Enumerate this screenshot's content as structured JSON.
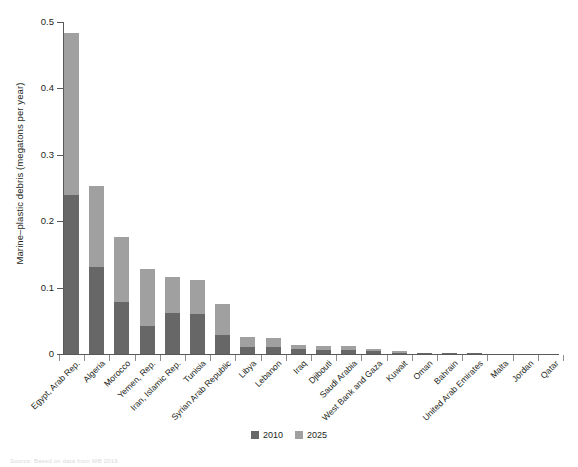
{
  "chart_data": {
    "type": "bar",
    "title": "",
    "subtitle": "",
    "xlabel": "",
    "ylabel": "Marine–plastic debris (megatons per year)",
    "ylim": [
      0,
      0.5
    ],
    "yticks": [
      0,
      0.1,
      0.2,
      0.3,
      0.4,
      0.5
    ],
    "ytick_labels": [
      "0",
      "0.1",
      "0.2",
      "0.3",
      "0.4",
      "0.5"
    ],
    "grid": false,
    "stacked": true,
    "legend_position": "bottom-center",
    "categories": [
      "Egypt, Arab Rep.",
      "Algeria",
      "Morocco",
      "Yemen, Rep.",
      "Iran, Islamic Rep.",
      "Tunisia",
      "Syrian Arab Republic",
      "Libya",
      "Lebanon",
      "Iraq",
      "Djibouti",
      "Saudi Arabia",
      "West Bank and Gaza",
      "Kuwait",
      "Oman",
      "Bahrain",
      "United Arab Emirates",
      "Malta",
      "Jordan",
      "Qatar"
    ],
    "series": [
      {
        "name": "2010",
        "color": "#676767",
        "values": [
          0.239,
          0.131,
          0.079,
          0.042,
          0.062,
          0.06,
          0.029,
          0.011,
          0.01,
          0.007,
          0.006,
          0.006,
          0.004,
          0.002,
          0.001,
          0.001,
          0.001,
          0.0,
          0.0,
          0.0
        ]
      },
      {
        "name": "2025",
        "color": "#a0a0a0",
        "values": [
          0.245,
          0.122,
          0.097,
          0.086,
          0.054,
          0.051,
          0.047,
          0.014,
          0.014,
          0.006,
          0.006,
          0.006,
          0.004,
          0.002,
          0.001,
          0.001,
          0.001,
          0.0,
          0.0,
          0.0
        ]
      }
    ],
    "totals": [
      0.484,
      0.253,
      0.176,
      0.128,
      0.116,
      0.111,
      0.076,
      0.025,
      0.024,
      0.013,
      0.012,
      0.012,
      0.008,
      0.004,
      0.002,
      0.002,
      0.002,
      0.001,
      0.001,
      0.001
    ]
  },
  "legend": {
    "items": [
      {
        "label": "2010",
        "color": "#676767"
      },
      {
        "label": "2025",
        "color": "#a0a0a0"
      }
    ]
  },
  "source_note": "Source: Based on data from WB 2019.",
  "colors": {
    "series_2010": "#676767",
    "series_2025": "#a0a0a0",
    "axis": "#58595b",
    "text": "#231f20",
    "background": "#ffffff"
  }
}
